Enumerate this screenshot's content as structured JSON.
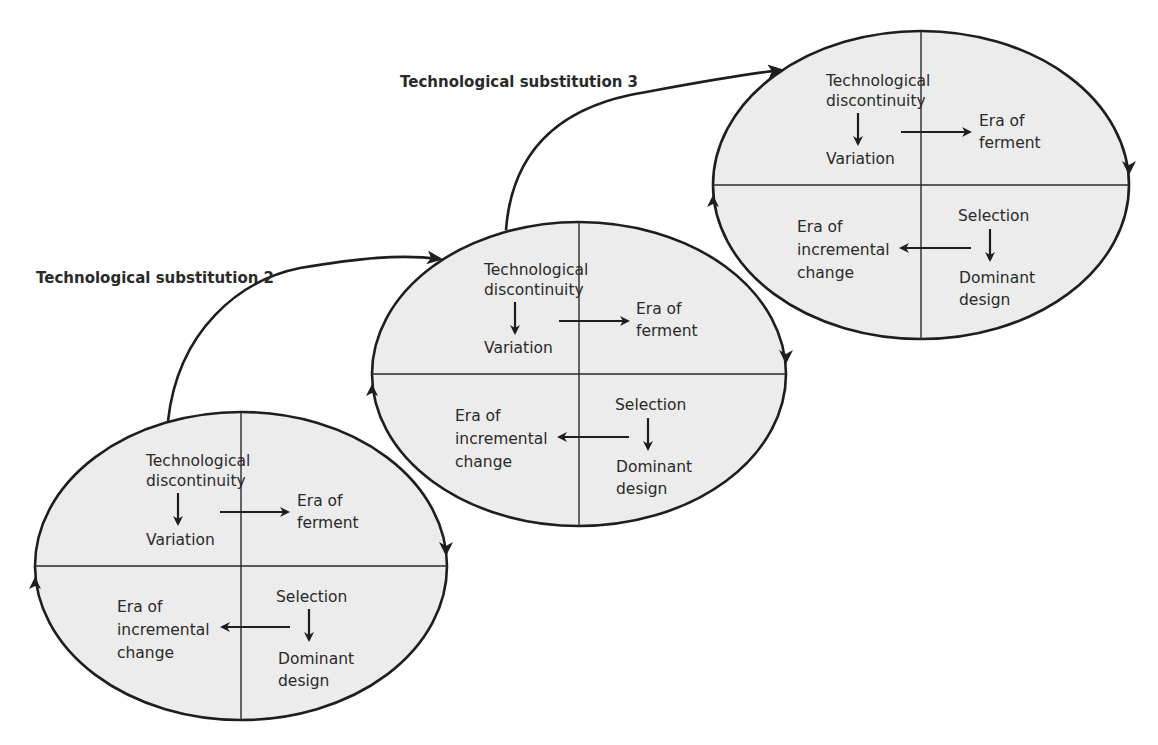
{
  "diagram": {
    "substitutions": [
      {
        "label": "Technological substitution 2"
      },
      {
        "label": "Technological substitution 3"
      }
    ],
    "cycles": [
      {
        "id": "cycle-1",
        "tech_discontinuity": [
          "Technological",
          "discontinuity"
        ],
        "variation": "Variation",
        "era_of_ferment": [
          "Era of",
          "ferment"
        ],
        "selection": "Selection",
        "dominant_design": [
          "Dominant",
          "design"
        ],
        "era_of_incremental_change": [
          "Era of",
          "incremental",
          "change"
        ]
      },
      {
        "id": "cycle-2",
        "tech_discontinuity": [
          "Technological",
          "discontinuity"
        ],
        "variation": "Variation",
        "era_of_ferment": [
          "Era of",
          "ferment"
        ],
        "selection": "Selection",
        "dominant_design": [
          "Dominant",
          "design"
        ],
        "era_of_incremental_change": [
          "Era of",
          "incremental",
          "change"
        ]
      },
      {
        "id": "cycle-3",
        "tech_discontinuity": [
          "Technological",
          "discontinuity"
        ],
        "variation": "Variation",
        "era_of_ferment": [
          "Era of",
          "ferment"
        ],
        "selection": "Selection",
        "dominant_design": [
          "Dominant",
          "design"
        ],
        "era_of_incremental_change": [
          "Era of",
          "incremental",
          "change"
        ]
      }
    ],
    "colors": {
      "ellipse_fill": "#ececec",
      "stroke": "#1e1e1e",
      "text": "#2a2a2a",
      "background": "#ffffff"
    }
  }
}
